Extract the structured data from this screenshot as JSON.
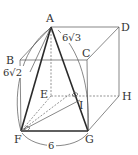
{
  "figure": {
    "type": "geometry-diagram",
    "vertices": {
      "A": {
        "label": "A",
        "x": 51,
        "y": 27
      },
      "B": {
        "label": "B",
        "x": 20,
        "y": 60
      },
      "C": {
        "label": "C",
        "x": 87,
        "y": 60
      },
      "D": {
        "label": "D",
        "x": 119,
        "y": 27
      },
      "E": {
        "label": "E",
        "x": 51,
        "y": 96
      },
      "F": {
        "label": "F",
        "x": 21,
        "y": 131
      },
      "G": {
        "label": "G",
        "x": 88,
        "y": 131
      },
      "H": {
        "label": "H",
        "x": 119,
        "y": 96
      },
      "I": {
        "label": "I",
        "x": 80,
        "y": 100
      }
    },
    "measurements": {
      "AF": "6√2",
      "AG": "6√3",
      "FG": "6"
    },
    "right_angle_markers": [
      "at I (FI ⟂ AG)",
      "at F (angle EFG region)"
    ]
  }
}
